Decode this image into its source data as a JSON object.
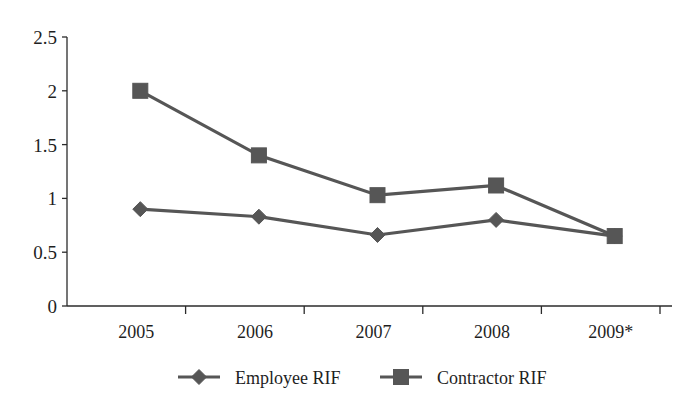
{
  "chart_data": {
    "type": "line",
    "title": "",
    "subtitle": "",
    "xlabel": "",
    "ylabel": "",
    "categories": [
      "2005",
      "2006",
      "2007",
      "2008",
      "2009*"
    ],
    "ylim": [
      0,
      2.5
    ],
    "y_ticks": [
      "0",
      "0.5",
      "1",
      "1.5",
      "2",
      "2.5"
    ],
    "y_tick_values": [
      0,
      0.5,
      1,
      1.5,
      2,
      2.5
    ],
    "grid": false,
    "legend_position": "bottom",
    "series": [
      {
        "name": "Employee RIF",
        "marker": "diamond",
        "color": "#565656",
        "values": [
          0.9,
          0.83,
          0.66,
          0.8,
          0.65
        ]
      },
      {
        "name": "Contractor RIF",
        "marker": "square",
        "color": "#565656",
        "values": [
          2.0,
          1.4,
          1.03,
          1.12,
          0.65
        ]
      }
    ],
    "annotations": []
  },
  "axes": {
    "y_axis_name": "y-axis",
    "x_axis_name": "x-axis"
  },
  "legend": {
    "items": [
      {
        "label": "Employee RIF",
        "marker": "diamond-marker-icon"
      },
      {
        "label": "Contractor RIF",
        "marker": "square-marker-icon"
      }
    ]
  },
  "colors": {
    "series": "#565656",
    "axis": "#2b2b2b",
    "text": "#1f1f1f",
    "background": "#ffffff"
  }
}
